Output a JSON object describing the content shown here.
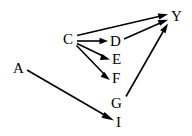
{
  "diagram": {
    "type": "directed-graph",
    "title": "",
    "background_color": "#ffffff",
    "edge_color": "#000000",
    "label_color": "#000000",
    "nodes": [
      {
        "id": "A",
        "label": "A",
        "x": 13,
        "y": 61
      },
      {
        "id": "C",
        "label": "C",
        "x": 63,
        "y": 32
      },
      {
        "id": "D",
        "label": "D",
        "x": 110,
        "y": 34
      },
      {
        "id": "E",
        "label": "E",
        "x": 112,
        "y": 52
      },
      {
        "id": "F",
        "label": "F",
        "x": 112,
        "y": 71
      },
      {
        "id": "G",
        "label": "G",
        "x": 111,
        "y": 96
      },
      {
        "id": "I",
        "label": "I",
        "x": 116,
        "y": 115
      },
      {
        "id": "Y",
        "label": "Y",
        "x": 171,
        "y": 9
      }
    ],
    "edges": [
      {
        "from": "C",
        "to": "Y",
        "x1": 77,
        "y1": 35,
        "x2": 166,
        "y2": 14
      },
      {
        "from": "C",
        "to": "D",
        "x1": 77,
        "y1": 41,
        "x2": 106,
        "y2": 41
      },
      {
        "from": "C",
        "to": "E",
        "x1": 77,
        "y1": 43,
        "x2": 109,
        "y2": 59
      },
      {
        "from": "C",
        "to": "F",
        "x1": 76,
        "y1": 45,
        "x2": 109,
        "y2": 78
      },
      {
        "from": "D",
        "to": "Y",
        "x1": 124,
        "y1": 39,
        "x2": 166,
        "y2": 20
      },
      {
        "from": "G",
        "to": "Y",
        "x1": 126,
        "y1": 96,
        "x2": 168,
        "y2": 24
      },
      {
        "from": "A",
        "to": "I",
        "x1": 27,
        "y1": 70,
        "x2": 113,
        "y2": 120
      }
    ],
    "edge_list_text": "C→Y, C→D, C→E, C→F, D→Y, G→Y, A→I"
  }
}
